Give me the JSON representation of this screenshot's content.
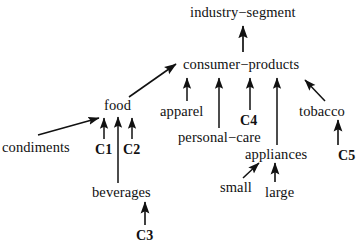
{
  "diagram": {
    "type": "directed-acyclic-graph",
    "stroke_color": "#111111",
    "background_color": "#ffffff",
    "nodes": [
      {
        "id": "industry-segment",
        "label": "industry−segment",
        "x": 190,
        "y": 5,
        "bold": false,
        "size": 14.5
      },
      {
        "id": "consumer-products",
        "label": "consumer−products",
        "x": 183,
        "y": 57,
        "bold": false,
        "size": 14.5
      },
      {
        "id": "food",
        "label": "food",
        "x": 104,
        "y": 98,
        "bold": false,
        "size": 14.5
      },
      {
        "id": "apparel",
        "label": "apparel",
        "x": 160,
        "y": 104,
        "bold": false,
        "size": 14.5
      },
      {
        "id": "tobacco",
        "label": "tobacco",
        "x": 299,
        "y": 104,
        "bold": false,
        "size": 14.5
      },
      {
        "id": "c4",
        "label": "C4",
        "x": 240,
        "y": 113,
        "bold": true,
        "size": 14
      },
      {
        "id": "personal-care",
        "label": "personal−care",
        "x": 178,
        "y": 130,
        "bold": false,
        "size": 14.5
      },
      {
        "id": "condiments",
        "label": "condiments",
        "x": 2,
        "y": 140,
        "bold": false,
        "size": 14.5
      },
      {
        "id": "c1",
        "label": "C1",
        "x": 95,
        "y": 142,
        "bold": true,
        "size": 14
      },
      {
        "id": "c2",
        "label": "C2",
        "x": 123,
        "y": 142,
        "bold": true,
        "size": 14
      },
      {
        "id": "appliances",
        "label": "appliances",
        "x": 245,
        "y": 147,
        "bold": false,
        "size": 14.5
      },
      {
        "id": "c5",
        "label": "C5",
        "x": 338,
        "y": 148,
        "bold": true,
        "size": 14
      },
      {
        "id": "small",
        "label": "small",
        "x": 220,
        "y": 180,
        "bold": false,
        "size": 14.5
      },
      {
        "id": "beverages",
        "label": "beverages",
        "x": 92,
        "y": 185,
        "bold": false,
        "size": 14.5
      },
      {
        "id": "large",
        "label": "large",
        "x": 265,
        "y": 185,
        "bold": false,
        "size": 14.5
      },
      {
        "id": "c3",
        "label": "C3",
        "x": 136,
        "y": 228,
        "bold": true,
        "size": 14
      }
    ],
    "edges": [
      {
        "from": "consumer-products",
        "to": "industry-segment",
        "kind": "vertical-arrow"
      },
      {
        "from": "food",
        "to": "consumer-products",
        "kind": "diagonal-arrow"
      },
      {
        "from": "apparel",
        "to": "consumer-products",
        "kind": "vertical-arrow"
      },
      {
        "from": "personal-care",
        "to": "consumer-products",
        "kind": "vertical-arrow"
      },
      {
        "from": "c4",
        "to": "consumer-products",
        "kind": "vertical-arrow"
      },
      {
        "from": "appliances",
        "to": "consumer-products",
        "kind": "vertical-arrow"
      },
      {
        "from": "tobacco",
        "to": "consumer-products",
        "kind": "diagonal-arrow"
      },
      {
        "from": "condiments",
        "to": "food",
        "kind": "diagonal-arrow"
      },
      {
        "from": "c1",
        "to": "food",
        "kind": "vertical-arrow"
      },
      {
        "from": "beverages",
        "to": "food",
        "kind": "vertical-arrow"
      },
      {
        "from": "c2",
        "to": "food",
        "kind": "vertical-arrow"
      },
      {
        "from": "c3",
        "to": "beverages",
        "kind": "vertical-arrow"
      },
      {
        "from": "small",
        "to": "appliances",
        "kind": "diagonal-arrow"
      },
      {
        "from": "large",
        "to": "appliances",
        "kind": "vertical-arrow"
      },
      {
        "from": "c5",
        "to": "tobacco",
        "kind": "vertical-arrow"
      }
    ]
  }
}
